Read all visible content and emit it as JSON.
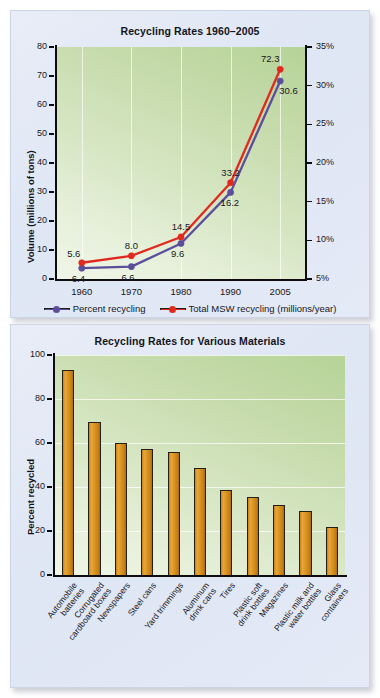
{
  "figure": {
    "background_color": "#ffffff",
    "panel_color": "#e3eaf6"
  },
  "chart_data": [
    {
      "type": "line",
      "title": "Recycling Rates 1960–2005",
      "xlabel": "",
      "ylabel": "Volume (millions of tons)",
      "y2label": "",
      "x": [
        "1960",
        "1970",
        "1980",
        "1990",
        "2005"
      ],
      "ylim": [
        0,
        80
      ],
      "yticks": [
        0,
        10,
        20,
        30,
        40,
        50,
        60,
        70,
        80
      ],
      "ytick_labels": [
        "0",
        "10",
        "20",
        "30",
        "40",
        "50",
        "60",
        "70",
        "80"
      ],
      "y2lim": [
        5,
        35
      ],
      "y2ticks": [
        5,
        10,
        15,
        20,
        25,
        30,
        35
      ],
      "y2tick_labels": [
        "5%",
        "10%",
        "15%",
        "20%",
        "25%",
        "30%",
        "35%"
      ],
      "grid": "vertical",
      "legend_position": "below",
      "series": [
        {
          "name": "Percent recycling",
          "color": "#5b4f9c",
          "axis": "right",
          "unit": "%",
          "values": [
            6.4,
            6.6,
            9.6,
            16.2,
            30.6
          ],
          "labels": [
            "6.4",
            "6.6",
            "9.6",
            "16.2",
            "30.6"
          ]
        },
        {
          "name": "Total MSW recycling (millions/year)",
          "color": "#e1291f",
          "axis": "left",
          "unit": "millions of tons",
          "values": [
            5.6,
            8.0,
            14.5,
            33.2,
            72.3
          ],
          "labels": [
            "5.6",
            "8.0",
            "14.5",
            "33.2",
            "72.3"
          ]
        }
      ]
    },
    {
      "type": "bar",
      "title": "Recycling Rates for Various Materials",
      "xlabel": "",
      "ylabel": "Percent recycled",
      "ylim": [
        0,
        100
      ],
      "yticks": [
        0,
        20,
        40,
        60,
        80,
        100
      ],
      "ytick_labels": [
        "0",
        "20",
        "40",
        "60",
        "80",
        "100"
      ],
      "grid": "horizontal",
      "bar_color": "#d9921f",
      "categories": [
        "Automobile batteries",
        "Corrugated cardboard boxes",
        "Newspapers",
        "Steel cans",
        "Yard trimmings",
        "Aluminum drink cans",
        "Tires",
        "Plastic soft drink bottles",
        "Magazines",
        "Plastic milk and water bottles",
        "Glass containers"
      ],
      "category_lines": [
        [
          "Automobile",
          "batteries"
        ],
        [
          "Corrugated",
          "cardboard boxes"
        ],
        [
          "Newspapers"
        ],
        [
          "Steel cans"
        ],
        [
          "Yard trimmings"
        ],
        [
          "Aluminum",
          "drink cans"
        ],
        [
          "Tires"
        ],
        [
          "Plastic soft",
          "drink bottles"
        ],
        [
          "Magazines"
        ],
        [
          "Plastic milk and",
          "water bottles"
        ],
        [
          "Glass",
          "containers"
        ]
      ],
      "values": [
        93,
        69.5,
        60,
        57.5,
        56,
        48.5,
        38.5,
        35.5,
        32,
        29,
        22
      ]
    }
  ]
}
